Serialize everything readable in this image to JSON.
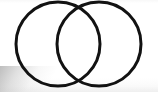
{
  "image": {
    "kind": "scanned-figure",
    "width": 158,
    "height": 92,
    "background_color": "#ffffff",
    "paper_edge_shadow_color": "#969696",
    "alt_text": "Two overlapping circles forming a Venn diagram drawn in thick black ink"
  },
  "figure": {
    "name": "two-overlapping-circles",
    "title": "Venn diagram of two overlapping circles",
    "stroke_color": "#121212",
    "stroke_width": 3,
    "fill": "none",
    "shapes": [
      {
        "id": "left-circle",
        "label": "Left circle",
        "cx": 58,
        "cy": 44,
        "r": 42
      },
      {
        "id": "right-circle",
        "label": "Right circle",
        "cx": 99,
        "cy": 44,
        "r": 42
      }
    ],
    "intersection": {
      "label": "Lens-shaped overlap region",
      "upper_point": {
        "x": 78,
        "y": 15
      },
      "lower_point": {
        "x": 78,
        "y": 73
      }
    }
  }
}
